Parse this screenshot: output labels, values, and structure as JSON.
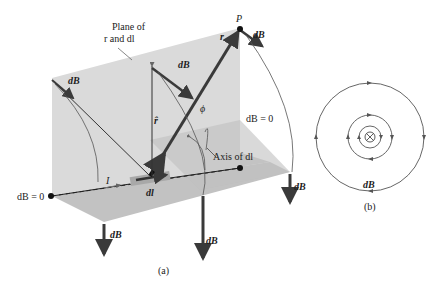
{
  "figure": {
    "panel_a": {
      "caption": "(a)",
      "plane_label_line1": "Plane of",
      "plane_label_line2": "r and dl",
      "point_label": "P",
      "current_label": "I",
      "element_label": "dl",
      "unit_vector_label": "r̂",
      "r_vector_label": "r",
      "angle_label": "ϕ",
      "axis_label": "Axis of dl",
      "db_zero_right": "dB = 0",
      "db_zero_left": "dB = 0",
      "db_labels": [
        "dB",
        "dB",
        "dB",
        "dB",
        "dB",
        "dB"
      ]
    },
    "panel_b": {
      "caption": "(b)",
      "db_label": "dB",
      "center_symbol": "⊗",
      "circles": 3
    },
    "colors": {
      "plane_vertical": "#d9d9d9",
      "plane_horizontal": "#bdbdbd",
      "vector": "#3a3a3a",
      "line": "#555555",
      "element": "#9a9a9a"
    }
  }
}
